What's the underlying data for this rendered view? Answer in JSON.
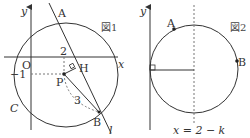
{
  "figure1": {
    "title": "図1",
    "axis_x_label": "x",
    "axis_y_label": "y",
    "origin_label": "O",
    "points": {
      "A": "A",
      "B": "B",
      "P": "P",
      "H": "H"
    },
    "curve_label": "C",
    "line_label": "l",
    "tick_x": "2",
    "tick_y": "−1",
    "segment_PB_label": "3"
  },
  "figure2": {
    "title": "図2",
    "axis_y_label": "y",
    "points": {
      "A": "A",
      "B": "B"
    },
    "dashed_line_label": "x = 2 − k"
  },
  "colors": {
    "stroke": "#333333",
    "dashed": "#777777"
  }
}
